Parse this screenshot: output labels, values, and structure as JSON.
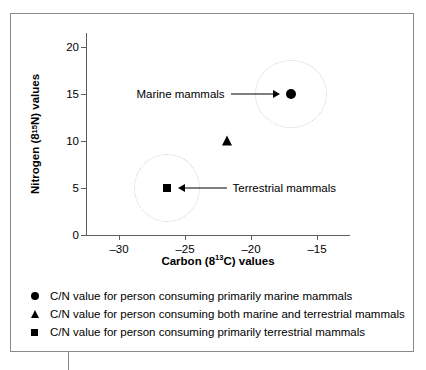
{
  "chart_data": {
    "type": "scatter",
    "title": "",
    "xlabel_parts": {
      "pre": "Carbon (8",
      "sup": "13",
      "post": "C) values"
    },
    "ylabel_parts": {
      "pre": "Nitrogen (8",
      "sup": "15",
      "post": "N) values"
    },
    "xlabel": "Carbon (8 13 C) values",
    "ylabel": "Nitrogen (8 15 N) values",
    "xlim": [
      -32.5,
      -12.5
    ],
    "ylim": [
      0,
      21.5
    ],
    "xticks": [
      -30,
      -25,
      -20,
      -15
    ],
    "xticklabels": [
      "–30",
      "–25",
      "–20",
      "–15"
    ],
    "yticks": [
      0,
      5,
      10,
      15,
      20
    ],
    "yticklabels": [
      "0",
      "5",
      "10",
      "15",
      "20"
    ],
    "grid": false,
    "legend_position": "below-plot",
    "points": [
      {
        "name": "marine-mammals-point",
        "marker": "circle",
        "x": -17.0,
        "y": 15
      },
      {
        "name": "mixed-diet-point",
        "marker": "triangle",
        "x": -21.8,
        "y": 10
      },
      {
        "name": "terrestrial-mammals-point",
        "marker": "square",
        "x": -26.4,
        "y": 5
      }
    ],
    "clusters": [
      {
        "name": "marine-cluster-ellipse",
        "center_x": -17.0,
        "center_y": 15,
        "rx_px": 35,
        "ry_px": 33
      },
      {
        "name": "terrestrial-cluster-ellipse",
        "center_x": -26.4,
        "center_y": 5,
        "rx_px": 32,
        "ry_px": 33
      }
    ],
    "annotations": [
      {
        "name": "marine-mammals-annotation",
        "text": "Marine mammals",
        "target_x": -17.0,
        "target_y": 15,
        "arrow_direction": "right"
      },
      {
        "name": "terrestrial-mammals-annotation",
        "text": "Terrestrial mammals",
        "target_x": -26.4,
        "target_y": 5,
        "arrow_direction": "left"
      }
    ],
    "legend": [
      {
        "marker": "circle",
        "label": "C/N value for person consuming primarily marine mammals"
      },
      {
        "marker": "triangle",
        "label": "C/N value for person consuming both marine and terrestrial mammals"
      },
      {
        "marker": "square",
        "label": "C/N value for person consuming primarily terrestrial mammals"
      }
    ],
    "colors": {
      "marker": "#000000",
      "axis": "#5d5d5d",
      "frame": "#8a8a8a",
      "ellipse": "#cfcfcf",
      "background": "#ffffff"
    }
  }
}
